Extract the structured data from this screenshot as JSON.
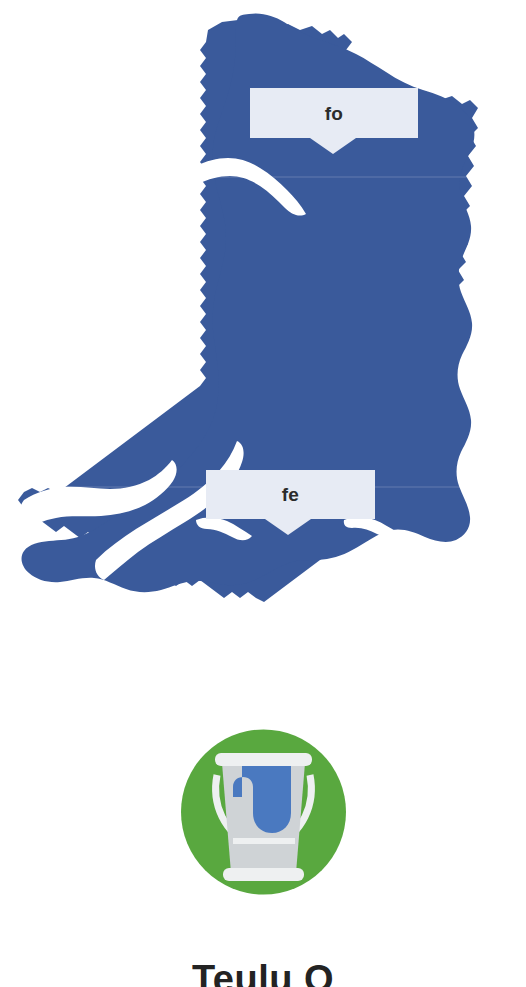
{
  "page": {
    "background_color": "#ffffff",
    "width": 526,
    "height": 987
  },
  "map": {
    "name": "map-of-wales",
    "fill_color": "#3a5a9b",
    "description": "Silhouette outline map of Wales"
  },
  "callouts": [
    {
      "id": "fo",
      "label": "fo",
      "background_color": "#e7ebf4",
      "text_color": "#2b2b2b"
    },
    {
      "id": "fe",
      "label": "fe",
      "background_color": "#e7ebf4",
      "text_color": "#2b2b2b"
    }
  ],
  "badge": {
    "icon_name": "paint-bucket-icon",
    "circle_color": "#59a83f",
    "bucket_color": "#cfd3d6",
    "bucket_highlight_color": "#eef0f1",
    "paint_color": "#4a79c0"
  },
  "caption": {
    "text": "Teulu O",
    "color": "#232323"
  }
}
